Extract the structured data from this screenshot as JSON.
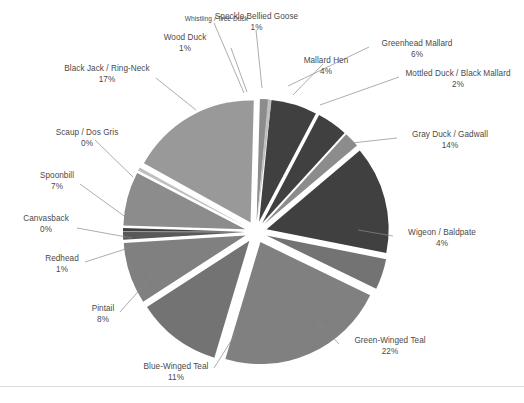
{
  "chart_data": {
    "type": "pie",
    "title": "",
    "subtitle": "",
    "xlabel": "",
    "ylabel": "",
    "exploded": true,
    "legend_position": "none",
    "label_format": "name + percent",
    "grid": false,
    "categories": [
      "Speckle Bellied Goose",
      "Greenhead Mallard",
      "Mallard Hen",
      "Mottled Duck / Black Mallard",
      "Gray Duck / Gadwall",
      "Wigeon / Baldpate",
      "Green-Winged Teal",
      "Blue-Winged Teal",
      "Pintail",
      "Redhead",
      "Canvasback",
      "Spoonbill",
      "Scaup / Dos Gris",
      "Black Jack / Ring-Neck",
      "Wood Duck",
      "Whistling / Tree Duck"
    ],
    "values": [
      1,
      6,
      4,
      2,
      14,
      4,
      22,
      11,
      8,
      1,
      0,
      7,
      0,
      17,
      1,
      0
    ],
    "value_labels": [
      "1%",
      "6%",
      "4%",
      "2%",
      "14%",
      "4%",
      "22%",
      "11%",
      "8%",
      "1%",
      "0%",
      "7%",
      "0%",
      "17%",
      "1%",
      ""
    ],
    "slice_colors": [
      "#a6a6a6",
      "#404040",
      "#404040",
      "#8c8c8c",
      "#404040",
      "#737373",
      "#808080",
      "#737373",
      "#808080",
      "#595959",
      "#404040",
      "#8c8c8c",
      "#bfbfbf",
      "#999999",
      "#8c8c8c",
      "#bfbfbf"
    ]
  },
  "labels": {
    "speckle_bellied_goose": {
      "name": "Speckle Bellied Goose",
      "percent": "1%"
    },
    "greenhead_mallard": {
      "name": "Greenhead Mallard",
      "percent": "6%"
    },
    "mallard_hen": {
      "name": "Mallard Hen",
      "percent": "4%"
    },
    "mottled_duck": {
      "name": "Mottled Duck / Black Mallard",
      "percent": "2%"
    },
    "gray_duck": {
      "name": "Gray Duck / Gadwall",
      "percent": "14%"
    },
    "wigeon": {
      "name": "Wigeon / Baldpate",
      "percent": "4%"
    },
    "green_winged_teal": {
      "name": "Green-Winged Teal",
      "percent": "22%"
    },
    "blue_winged_teal": {
      "name": "Blue-Winged Teal",
      "percent": "11%"
    },
    "pintail": {
      "name": "Pintail",
      "percent": "8%"
    },
    "redhead": {
      "name": "Redhead",
      "percent": "1%"
    },
    "canvasback": {
      "name": "Canvasback",
      "percent": "0%"
    },
    "spoonbill": {
      "name": "Spoonbill",
      "percent": "7%"
    },
    "scaup": {
      "name": "Scaup / Dos Gris",
      "percent": "0%"
    },
    "black_jack": {
      "name": "Black Jack / Ring-Neck",
      "percent": "17%"
    },
    "wood_duck": {
      "name": "Wood Duck",
      "percent": "1%"
    },
    "whistling_tree_duck": {
      "name": "Whistling / Tree Duck",
      "percent": ""
    }
  },
  "style": {
    "background": "#ffffff",
    "label_color": "#4a4a4a",
    "leader_color": "#808080",
    "border_color": "#dcdcdc"
  }
}
